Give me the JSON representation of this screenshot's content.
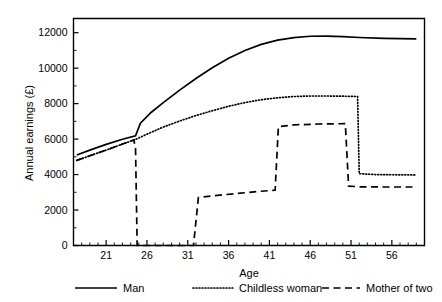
{
  "chart_data": {
    "type": "line",
    "title": "",
    "xlabel": "Age",
    "ylabel": "Annual earnings (£)",
    "xlim": [
      17,
      60
    ],
    "ylim": [
      0,
      12800
    ],
    "grid": false,
    "legend_position": "bottom",
    "x_ticks": [
      21,
      26,
      31,
      36,
      41,
      46,
      51,
      56
    ],
    "x_tick_labels": [
      "21",
      "26",
      "31",
      "36",
      "41",
      "46",
      "51",
      "56"
    ],
    "x_minor_tick_step": 1,
    "y_ticks": [
      0,
      2000,
      4000,
      6000,
      8000,
      10000,
      12000
    ],
    "y_tick_labels": [
      "0",
      "2000",
      "4000",
      "6000",
      "8000",
      "10000",
      "12000"
    ],
    "y_minor_tick_step": 1000,
    "series": [
      {
        "name": "Man",
        "style": "solid",
        "color": "#000000",
        "points": [
          [
            17.4,
            5100
          ],
          [
            19.0,
            5380
          ],
          [
            21.0,
            5700
          ],
          [
            23.0,
            5990
          ],
          [
            24.6,
            6180
          ],
          [
            25.2,
            6900
          ],
          [
            26.5,
            7500
          ],
          [
            28.0,
            8060
          ],
          [
            30.0,
            8760
          ],
          [
            32.0,
            9420
          ],
          [
            34.0,
            10020
          ],
          [
            36.0,
            10560
          ],
          [
            38.0,
            11000
          ],
          [
            40.0,
            11340
          ],
          [
            42.0,
            11580
          ],
          [
            44.0,
            11720
          ],
          [
            46.0,
            11800
          ],
          [
            48.0,
            11810
          ],
          [
            50.0,
            11780
          ],
          [
            52.0,
            11730
          ],
          [
            55.0,
            11680
          ],
          [
            59.0,
            11650
          ]
        ]
      },
      {
        "name": "Childless woman",
        "style": "dotted",
        "color": "#000000",
        "points": [
          [
            17.4,
            4800
          ],
          [
            19.0,
            5060
          ],
          [
            21.0,
            5380
          ],
          [
            23.0,
            5720
          ],
          [
            24.6,
            5980
          ],
          [
            26.0,
            6280
          ],
          [
            28.0,
            6680
          ],
          [
            30.0,
            7020
          ],
          [
            32.0,
            7330
          ],
          [
            34.0,
            7600
          ],
          [
            36.0,
            7850
          ],
          [
            38.0,
            8060
          ],
          [
            40.0,
            8220
          ],
          [
            42.0,
            8330
          ],
          [
            44.0,
            8400
          ],
          [
            46.0,
            8430
          ],
          [
            48.0,
            8430
          ],
          [
            50.0,
            8420
          ],
          [
            51.8,
            8400
          ],
          [
            52.0,
            4050
          ],
          [
            54.0,
            4000
          ],
          [
            56.0,
            3990
          ],
          [
            59.0,
            3980
          ]
        ]
      },
      {
        "name": "Mother of two",
        "style": "dashed",
        "color": "#000000",
        "points": [
          [
            17.4,
            4800
          ],
          [
            19.0,
            5060
          ],
          [
            21.0,
            5380
          ],
          [
            23.0,
            5720
          ],
          [
            24.4,
            5950
          ],
          [
            24.6,
            5450
          ],
          [
            24.8,
            0
          ],
          [
            31.7,
            0
          ],
          [
            32.3,
            2700
          ],
          [
            34.0,
            2800
          ],
          [
            37.0,
            2930
          ],
          [
            40.0,
            3060
          ],
          [
            41.7,
            3120
          ],
          [
            42.1,
            6700
          ],
          [
            44.0,
            6800
          ],
          [
            47.0,
            6850
          ],
          [
            50.3,
            6870
          ],
          [
            50.7,
            3350
          ],
          [
            52.0,
            3310
          ],
          [
            55.0,
            3300
          ],
          [
            59.0,
            3300
          ]
        ]
      }
    ]
  },
  "legend": {
    "items": [
      {
        "label": "Man",
        "style": "solid"
      },
      {
        "label": "Childless woman",
        "style": "dotted"
      },
      {
        "label": "Mother of two",
        "style": "dashed"
      }
    ]
  }
}
